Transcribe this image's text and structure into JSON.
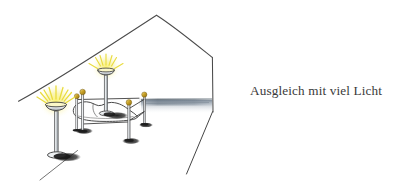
{
  "image": {
    "kind": "hand-drawn-sketch",
    "subject": "attic bedroom with gabled roof, four-poster bed and two floor lamps",
    "background_color": "#ffffff",
    "width": 406,
    "height": 188
  },
  "caption": {
    "text": "Ausgleich mit viel Licht",
    "color": "#3a3a3a",
    "align": "left"
  },
  "palette": {
    "ink": "#3c3c3c",
    "ink_light": "#6e6e6e",
    "lamp_glow": "#f2e85c",
    "lamp_glow_soft": "#fbf6a8",
    "brass": "#c9a227",
    "brass_light": "#e8cf6a",
    "metal": "#b8bcc0",
    "metal_light": "#e6e9ec",
    "shadow": "#1b1b1b",
    "wall_haze": "#8a97a6",
    "wall_haze_light": "#cdd6de"
  },
  "scene": {
    "roof": {
      "label": "gabled roof line",
      "peak": {
        "x": 157,
        "y": 15
      },
      "left_end": {
        "x": 18,
        "y": 101
      },
      "right_corner": {
        "x": 212,
        "y": 57
      },
      "right_wall_bottom": {
        "x": 213,
        "y": 112
      }
    },
    "floor_haze": {
      "label": "grey floor / wall haze band",
      "x": 140,
      "y": 99,
      "width": 72,
      "height": 16,
      "color": "#8a97a6"
    },
    "right_diagonal": {
      "label": "floor edge line lower right",
      "from": {
        "x": 212,
        "y": 112
      },
      "to": {
        "x": 186,
        "y": 174
      }
    },
    "left_diagonal": {
      "label": "floor edge line lower left",
      "from": {
        "x": 77,
        "y": 150
      },
      "to": {
        "x": 40,
        "y": 180
      }
    },
    "lamps": [
      {
        "name": "floor-lamp-left",
        "bowl_center": {
          "x": 56,
          "y": 103
        },
        "bowl_width": 20,
        "glow_radius": 17,
        "pole_height": 50,
        "base_center": {
          "x": 60,
          "y": 155
        },
        "base_width": 22
      },
      {
        "name": "floor-lamp-center",
        "bowl_center": {
          "x": 106,
          "y": 68
        },
        "bowl_width": 17,
        "glow_radius": 14,
        "pole_height": 44,
        "base_center": {
          "x": 110,
          "y": 114
        },
        "base_width": 18
      }
    ],
    "bed": {
      "name": "four-poster-bed",
      "posts": [
        {
          "id": "post-back-left",
          "x": 76,
          "top_y": 94,
          "height": 34
        },
        {
          "id": "post-back-right",
          "x": 138,
          "top_y": 94,
          "height": 32
        },
        {
          "id": "post-front-left",
          "x": 81,
          "top_y": 90,
          "height": 40
        },
        {
          "id": "post-front-right",
          "x": 128,
          "top_y": 103,
          "height": 36
        }
      ],
      "mattress": {
        "x": 74,
        "y": 104,
        "width": 62,
        "height": 17
      },
      "finial_color": "#c9a227"
    }
  }
}
